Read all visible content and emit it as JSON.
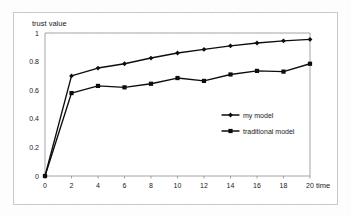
{
  "chart_data": {
    "type": "line",
    "title": "",
    "xlabel": "time",
    "ylabel": "trust value",
    "xlim": [
      0,
      20
    ],
    "ylim": [
      0,
      1
    ],
    "grid": false,
    "legend_position": "center-right",
    "x": [
      0,
      2,
      4,
      6,
      8,
      10,
      12,
      14,
      16,
      18,
      20
    ],
    "xticks": [
      "0",
      "2",
      "4",
      "6",
      "8",
      "10",
      "12",
      "14",
      "16",
      "18",
      "20"
    ],
    "yticks": [
      "0",
      "0.2",
      "0.4",
      "0.6",
      "0.8",
      "1"
    ],
    "ytick_values": [
      0,
      0.2,
      0.4,
      0.6,
      0.8,
      1
    ],
    "series": [
      {
        "name": "my model",
        "marker": "diamond",
        "color": "#0d0d0d",
        "values": [
          0,
          0.7,
          0.755,
          0.785,
          0.825,
          0.86,
          0.885,
          0.91,
          0.93,
          0.945,
          0.955
        ]
      },
      {
        "name": "traditional model",
        "marker": "square",
        "color": "#0d0d0d",
        "values": [
          0,
          0.58,
          0.63,
          0.62,
          0.645,
          0.685,
          0.665,
          0.71,
          0.735,
          0.73,
          0.785
        ]
      }
    ]
  },
  "axes": {
    "y_title": "trust value",
    "x_title": "time"
  },
  "legend": {
    "entries": [
      {
        "label": "my model"
      },
      {
        "label": "traditional model"
      }
    ]
  },
  "colors": {
    "line": "#0d0d0d",
    "axis": "#8d8d8d",
    "frame": "#c9c9c9",
    "text": "#1a1a1a",
    "background": "#ffffff"
  }
}
